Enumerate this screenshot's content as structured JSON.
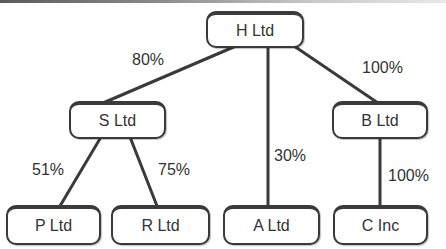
{
  "diagram": {
    "type": "group-structure-tree",
    "nodes": [
      {
        "id": "h",
        "label": "H Ltd"
      },
      {
        "id": "s",
        "label": "S Ltd"
      },
      {
        "id": "b",
        "label": "B Ltd"
      },
      {
        "id": "p",
        "label": "P Ltd"
      },
      {
        "id": "r",
        "label": "R Ltd"
      },
      {
        "id": "a",
        "label": "A Ltd"
      },
      {
        "id": "c",
        "label": "C Inc"
      }
    ],
    "edges": [
      {
        "from": "H Ltd",
        "to": "S Ltd",
        "label": "80%"
      },
      {
        "from": "H Ltd",
        "to": "A Ltd",
        "label": "30%"
      },
      {
        "from": "H Ltd",
        "to": "B Ltd",
        "label": "100%"
      },
      {
        "from": "S Ltd",
        "to": "P Ltd",
        "label": "51%"
      },
      {
        "from": "S Ltd",
        "to": "R Ltd",
        "label": "75%"
      },
      {
        "from": "B Ltd",
        "to": "C Inc",
        "label": "100%"
      }
    ]
  },
  "colors": {
    "line": "#3a3a3a",
    "text": "#333333",
    "background": "#ffffff"
  }
}
